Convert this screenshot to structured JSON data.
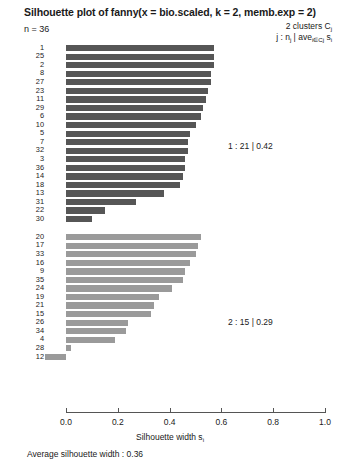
{
  "header": {
    "title": "Silhouette plot of fanny(x = bio.scaled, k = 2, memb.exp = 2)",
    "n_label": "n = 36",
    "legend_line1": "2 clusters  C",
    "legend_line1_sub": "j",
    "legend_line2_prefix": "j :  n",
    "legend_line2_sub1": "j",
    "legend_line2_mid": " | ave",
    "legend_line2_sub2": "i∈Cj",
    "legend_line2_suffix": " s",
    "legend_line2_sub3": "i"
  },
  "annotations": {
    "cluster1_summary": "1 :  21  |  0.42",
    "cluster2_summary": "2 :  15  |  0.29"
  },
  "footer": {
    "average_label": "Average silhouette width :  0.36",
    "xaxis_title": "Silhouette width s",
    "xaxis_title_sub": "i"
  },
  "colors": {
    "cluster1": "#565656",
    "cluster2": "#9a9a9a",
    "axis": "#555555",
    "text": "#1a1a1a"
  },
  "chart_data": {
    "type": "bar",
    "title": "Silhouette plot of fanny(x = bio.scaled, k = 2, memb.exp = 2)",
    "xlabel": "Silhouette width s_i",
    "ylabel": "",
    "orientation": "horizontal",
    "xlim": [
      -0.1,
      1.0
    ],
    "xticks": [
      "0.0",
      "0.2",
      "0.4",
      "0.6",
      "0.8",
      "1.0"
    ],
    "xtick_values": [
      0.0,
      0.2,
      0.4,
      0.6,
      0.8,
      1.0
    ],
    "grid": false,
    "n_observations": 36,
    "n_clusters": 2,
    "average_silhouette_width": 0.36,
    "legend_position": "top-right",
    "clusters": [
      {
        "id": 1,
        "size": 21,
        "avg_silhouette": 0.42,
        "color": "#565656",
        "categories": [
          "1",
          "25",
          "2",
          "8",
          "27",
          "23",
          "11",
          "29",
          "6",
          "10",
          "5",
          "7",
          "32",
          "3",
          "36",
          "14",
          "18",
          "13",
          "31",
          "22",
          "30"
        ],
        "values": [
          0.57,
          0.57,
          0.57,
          0.56,
          0.56,
          0.55,
          0.54,
          0.53,
          0.52,
          0.5,
          0.48,
          0.47,
          0.47,
          0.46,
          0.46,
          0.45,
          0.44,
          0.38,
          0.27,
          0.15,
          0.1
        ]
      },
      {
        "id": 2,
        "size": 15,
        "avg_silhouette": 0.29,
        "color": "#9a9a9a",
        "categories": [
          "20",
          "17",
          "33",
          "16",
          "9",
          "35",
          "24",
          "19",
          "21",
          "15",
          "26",
          "34",
          "4",
          "28",
          "12"
        ],
        "values": [
          0.52,
          0.51,
          0.5,
          0.48,
          0.46,
          0.45,
          0.41,
          0.36,
          0.34,
          0.33,
          0.24,
          0.23,
          0.19,
          0.02,
          -0.08,
          -0.08
        ]
      }
    ]
  }
}
